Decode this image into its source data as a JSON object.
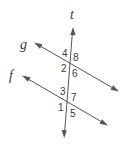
{
  "diagram": {
    "type": "parallel-lines-transversal",
    "line_color": "#555555",
    "text_color": "#3a3a3a",
    "lines": {
      "t": {
        "label": "t",
        "role": "transversal"
      },
      "g": {
        "label": "g",
        "role": "parallel-line"
      },
      "f": {
        "label": "f",
        "role": "parallel-line"
      }
    },
    "upper_intersection": {
      "lines": [
        "t",
        "g"
      ],
      "angles": {
        "top_left": "4",
        "top_right": "8",
        "bottom_left": "2",
        "bottom_right": "6"
      }
    },
    "lower_intersection": {
      "lines": [
        "t",
        "f"
      ],
      "angles": {
        "top_left": "3",
        "top_right": "7",
        "bottom_left": "1",
        "bottom_right": "5"
      }
    }
  }
}
